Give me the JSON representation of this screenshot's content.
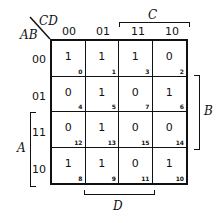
{
  "labels": {
    "row_var": "AB",
    "col_var": "CD",
    "C": "C",
    "B": "B",
    "A": "A",
    "D": "D"
  },
  "col_headers": [
    "00",
    "01",
    "11",
    "10"
  ],
  "row_headers": [
    "00",
    "01",
    "11",
    "10"
  ],
  "cells": [
    [
      {
        "value": "1",
        "index": "0"
      },
      {
        "value": "1",
        "index": "1"
      },
      {
        "value": "1",
        "index": "3"
      },
      {
        "value": "0",
        "index": "2"
      }
    ],
    [
      {
        "value": "0",
        "index": "4"
      },
      {
        "value": "1",
        "index": "5"
      },
      {
        "value": "0",
        "index": "7"
      },
      {
        "value": "1",
        "index": "6"
      }
    ],
    [
      {
        "value": "0",
        "index": "12"
      },
      {
        "value": "1",
        "index": "13"
      },
      {
        "value": "0",
        "index": "15"
      },
      {
        "value": "0",
        "index": "14"
      }
    ],
    [
      {
        "value": "1",
        "index": "8"
      },
      {
        "value": "1",
        "index": "9"
      },
      {
        "value": "0",
        "index": "11"
      },
      {
        "value": "1",
        "index": "10"
      }
    ]
  ]
}
